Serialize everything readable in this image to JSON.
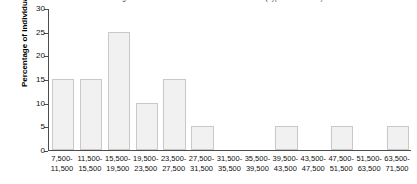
{
  "chart_data": {
    "type": "bar",
    "title": "Percentage distribution of annual income of individuals (hypothetical data)",
    "xlabel": "",
    "ylabel": "Percentage of individuals",
    "ylim": [
      0,
      30
    ],
    "yticks": [
      0,
      5,
      10,
      15,
      20,
      25,
      30
    ],
    "grid": false,
    "legend": "none",
    "categories": [
      "7,500-\n11,500",
      "11,500-\n15,500",
      "15,500-\n19,500",
      "19,500-\n23,500",
      "23,500-\n27,500",
      "27,500-\n31,500",
      "31,500-\n35,500",
      "35,500-\n39,500",
      "39,500-\n43,500",
      "43,500-\n47,500",
      "47,500-\n51,500",
      "51,500-\n63,500",
      "63,500-\n71,500"
    ],
    "bins": [
      {
        "lower": "7,500-",
        "upper": "11,500",
        "value": 15
      },
      {
        "lower": "11,500-",
        "upper": "15,500",
        "value": 15
      },
      {
        "lower": "15,500-",
        "upper": "19,500",
        "value": 25
      },
      {
        "lower": "19,500-",
        "upper": "23,500",
        "value": 10
      },
      {
        "lower": "23,500-",
        "upper": "27,500",
        "value": 15
      },
      {
        "lower": "27,500-",
        "upper": "31,500",
        "value": 5
      },
      {
        "lower": "31,500-",
        "upper": "35,500",
        "value": 0
      },
      {
        "lower": "35,500-",
        "upper": "39,500",
        "value": 0
      },
      {
        "lower": "39,500-",
        "upper": "43,500",
        "value": 5
      },
      {
        "lower": "43,500-",
        "upper": "47,500",
        "value": 0
      },
      {
        "lower": "47,500-",
        "upper": "51,500",
        "value": 5
      },
      {
        "lower": "51,500-",
        "upper": "63,500",
        "value": 0
      },
      {
        "lower": "63,500-",
        "upper": "71,500",
        "value": 5
      }
    ],
    "values": [
      15,
      15,
      25,
      10,
      15,
      5,
      0,
      0,
      5,
      0,
      5,
      0,
      5
    ],
    "colors": {
      "bar_fill": "#f1f1f1",
      "bar_border": "#c9c9c9",
      "axis": "#4d4d4d",
      "text": "#111111"
    }
  }
}
